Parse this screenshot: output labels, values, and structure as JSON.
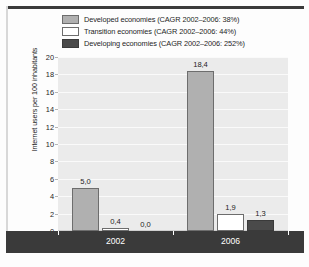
{
  "chart_data": {
    "type": "bar",
    "title": "",
    "subtitle": "",
    "xlabel": "",
    "ylabel": "Internet users per 100 inhabitants",
    "categories": [
      "2002",
      "2006"
    ],
    "ylim": [
      0,
      20
    ],
    "yticks": [
      0,
      2,
      4,
      6,
      8,
      10,
      12,
      14,
      16,
      18,
      20
    ],
    "ytick_labels": [
      "0",
      "2",
      "4",
      "6",
      "8",
      "10",
      "12",
      "14",
      "16",
      "18",
      "20"
    ],
    "grid": true,
    "legend_position": "top",
    "decimal_separator": ",",
    "series": [
      {
        "name": "Developed economies (CAGR 2002–2006: 38%)",
        "short_name": "Developed economies",
        "cagr": "38%",
        "color": "#b0b0b0",
        "values": [
          5.0,
          18.4
        ],
        "data_labels": [
          "5,0",
          "18,4"
        ]
      },
      {
        "name": "Transition economies (CAGR 2002–2006: 44%)",
        "short_name": "Transition economies",
        "cagr": "44%",
        "color": "#ffffff",
        "values": [
          0.4,
          1.9
        ],
        "data_labels": [
          "0,4",
          "1,9"
        ]
      },
      {
        "name": "Developing economies (CAGR 2002–2006: 252%)",
        "short_name": "Developing economies",
        "cagr": "252%",
        "color": "#4a4a4a",
        "values": [
          0.0,
          1.3
        ],
        "data_labels": [
          "0,0",
          "1,3"
        ]
      }
    ]
  },
  "legend": {
    "items": [
      {
        "label": "Developed economies (CAGR 2002–2006: 38%)",
        "swatch": "developed"
      },
      {
        "label": "Transition economies (CAGR 2002–2006: 44%)",
        "swatch": "transition"
      },
      {
        "label": "Developing economies (CAGR 2002–2006: 252%)",
        "swatch": "developing"
      }
    ]
  },
  "caption": {
    "text": ""
  },
  "colors": {
    "developed": "#b0b0b0",
    "transition": "#ffffff",
    "developing": "#4a4a4a",
    "plot_background": "#ebebeb",
    "axis_band": "#3a3a3a",
    "gridline": "#fafafa"
  }
}
